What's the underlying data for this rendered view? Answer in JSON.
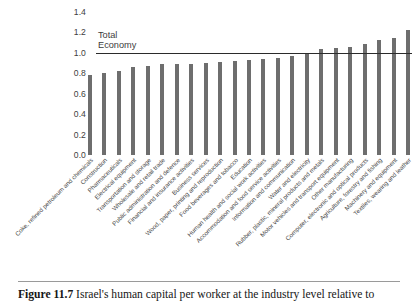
{
  "figure": {
    "caption_label": "Figure 11.7",
    "caption_text": "Israel's human capital per worker at the industry level relative to"
  },
  "reference_line": {
    "label_line1": "Total",
    "label_line2": "Economy",
    "value": 1.0
  },
  "colors": {
    "bar": "#6e6e6e",
    "reference_line": "#2b2b2b",
    "text": "#3d3d3d",
    "background": "#ffffff"
  },
  "chart_data": {
    "type": "bar",
    "title": "",
    "xlabel": "",
    "ylabel": "",
    "ylim": [
      0.0,
      1.4
    ],
    "yticks": [
      "0.0",
      "0.2",
      "0.4",
      "0.6",
      "0.8",
      "1.0",
      "1.2",
      "1.4"
    ],
    "ytick_values": [
      0.0,
      0.2,
      0.4,
      0.6,
      0.8,
      1.0,
      1.2,
      1.4
    ],
    "grid": false,
    "legend": "none",
    "annotations": [
      "Total Economy reference line at 1.0"
    ],
    "categories": [
      "Coke, refined petroleum and chemicals",
      "Construction",
      "Pharmaceuticals",
      "Electrical equipment",
      "Transportation and storage",
      "Wholesale and retail trade",
      "Public administration and defence",
      "Financial and insurance activities",
      "Business services",
      "Wood, paper, printing and reproduction",
      "Food beverages and tobacco",
      "Education",
      "Human health and social work activities",
      "Accommodation and food service activities",
      "Information and communication",
      "Water and electricity",
      "Rubber, plastic, mineral products and metals",
      "Motor vehicles and transport equipment",
      "Other manufacturing",
      "Computer, electronic and optical products",
      "Agriculture, forestry and fishing",
      "Machinery and equipment",
      "Textiles, wearing and leather"
    ],
    "values": [
      0.78,
      0.8,
      0.82,
      0.86,
      0.87,
      0.89,
      0.89,
      0.89,
      0.9,
      0.91,
      0.92,
      0.93,
      0.94,
      0.95,
      0.97,
      1.0,
      1.04,
      1.05,
      1.06,
      1.09,
      1.13,
      1.15,
      1.22
    ]
  }
}
